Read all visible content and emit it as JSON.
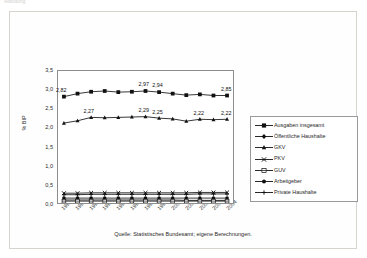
{
  "top_caption": "Abbildung",
  "source_note": "Quelle: Statistisches Bundesamt; eigene Berechnungen.",
  "axes": {
    "ylabel": "% BIP",
    "yticks": [
      "0,0",
      "0,5",
      "1,0",
      "1,5",
      "2,0",
      "2,5",
      "3,0",
      "3,5"
    ]
  },
  "legend": {
    "items": [
      {
        "label": "Ausgaben insgesamt",
        "marker": "filled-square-marker"
      },
      {
        "label": "Öffentliche Haushalte",
        "marker": "filled-diamond-marker"
      },
      {
        "label": "GKV",
        "marker": "filled-triangle-marker"
      },
      {
        "label": "PKV",
        "marker": "cross-marker"
      },
      {
        "label": "GUV",
        "marker": "open-square-marker"
      },
      {
        "label": "Arbeitgeber",
        "marker": "filled-circle-marker"
      },
      {
        "label": "Private Haushalte",
        "marker": "plus-marker"
      }
    ]
  },
  "chart_data": {
    "type": "line",
    "title": "",
    "xlabel": "",
    "ylabel": "% BIP",
    "ylim": [
      0,
      3.5
    ],
    "ytick_step": 0.5,
    "grid": false,
    "legend_position": "right",
    "categories": [
      "1992",
      "1993",
      "1994",
      "1995",
      "1996",
      "1997",
      "1998",
      "1999",
      "2000",
      "2001",
      "2002",
      "2003",
      "2004"
    ],
    "series": [
      {
        "name": "Ausgaben insgesamt",
        "marker": "filled-square-marker",
        "values": [
          2.82,
          2.9,
          2.95,
          2.97,
          2.94,
          2.95,
          2.97,
          2.94,
          2.9,
          2.86,
          2.88,
          2.85,
          2.85
        ],
        "point_labels": [
          {
            "index": 0,
            "text": "2,82"
          },
          {
            "index": 6,
            "text": "2,97"
          },
          {
            "index": 7,
            "text": "2,94"
          },
          {
            "index": 12,
            "text": "2,85"
          }
        ]
      },
      {
        "name": "GKV",
        "marker": "filled-triangle-marker",
        "values": [
          2.12,
          2.18,
          2.27,
          2.26,
          2.27,
          2.28,
          2.29,
          2.25,
          2.23,
          2.17,
          2.22,
          2.21,
          2.22
        ],
        "point_labels": [
          {
            "index": 2,
            "text": "2,27"
          },
          {
            "index": 6,
            "text": "2,29"
          },
          {
            "index": 7,
            "text": "2,25"
          },
          {
            "index": 10,
            "text": "2,22"
          },
          {
            "index": 12,
            "text": "2,22"
          }
        ]
      },
      {
        "name": "PKV",
        "marker": "cross-marker",
        "values": [
          0.26,
          0.26,
          0.27,
          0.27,
          0.27,
          0.27,
          0.27,
          0.27,
          0.27,
          0.27,
          0.28,
          0.28,
          0.28
        ],
        "point_labels": []
      },
      {
        "name": "Private Haushalte",
        "marker": "plus-marker",
        "values": [
          0.22,
          0.22,
          0.23,
          0.23,
          0.23,
          0.23,
          0.23,
          0.23,
          0.23,
          0.23,
          0.24,
          0.24,
          0.24
        ],
        "point_labels": []
      },
      {
        "name": "Arbeitgeber",
        "marker": "filled-circle-marker",
        "values": [
          0.13,
          0.13,
          0.13,
          0.13,
          0.13,
          0.13,
          0.13,
          0.13,
          0.13,
          0.13,
          0.13,
          0.13,
          0.13
        ],
        "point_labels": []
      },
      {
        "name": "Öffentliche Haushalte",
        "marker": "filled-diamond-marker",
        "values": [
          0.08,
          0.08,
          0.08,
          0.08,
          0.08,
          0.08,
          0.08,
          0.08,
          0.08,
          0.07,
          0.07,
          0.07,
          0.07
        ],
        "point_labels": []
      },
      {
        "name": "GUV",
        "marker": "open-square-marker",
        "values": [
          0.05,
          0.05,
          0.05,
          0.05,
          0.05,
          0.05,
          0.05,
          0.05,
          0.05,
          0.05,
          0.05,
          0.05,
          0.05
        ],
        "point_labels": []
      }
    ]
  }
}
